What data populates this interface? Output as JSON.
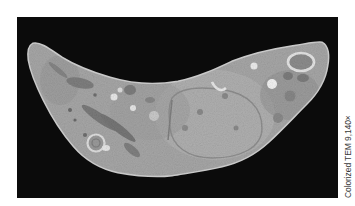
{
  "figure": {
    "background_color": "#0b0b0b",
    "cell_color": "#a9a9a9",
    "caption": "Colorized TEM 9,140×"
  }
}
